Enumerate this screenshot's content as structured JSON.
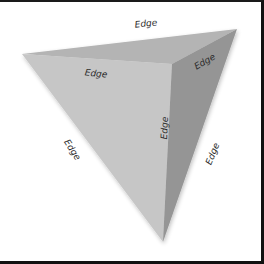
{
  "diagram": {
    "type": "tetrahedron",
    "vertices": {
      "left": [
        22,
        52
      ],
      "top_right": [
        237,
        27
      ],
      "front": [
        172,
        62
      ],
      "bottom": [
        163,
        240
      ]
    },
    "faces": [
      {
        "name": "front-left-face",
        "color": "#c6c6c6"
      },
      {
        "name": "top-face",
        "color": "#b4b4b4"
      },
      {
        "name": "right-face",
        "color": "#959595"
      }
    ],
    "labels": [
      {
        "name": "edge-label-top-back",
        "text": "Edge",
        "x": 146,
        "y": 22,
        "rotate": -6
      },
      {
        "name": "edge-label-top-left",
        "text": "Edge",
        "x": 96,
        "y": 72,
        "rotate": 6
      },
      {
        "name": "edge-label-top-right",
        "text": "Edge",
        "x": 205,
        "y": 60,
        "rotate": -30
      },
      {
        "name": "edge-label-vertical",
        "text": "Edge",
        "x": 165,
        "y": 126,
        "rotate": -88
      },
      {
        "name": "edge-label-left",
        "text": "Edge",
        "x": 72,
        "y": 148,
        "rotate": 57
      },
      {
        "name": "edge-label-right",
        "text": "Edge",
        "x": 213,
        "y": 152,
        "rotate": -68
      }
    ]
  }
}
